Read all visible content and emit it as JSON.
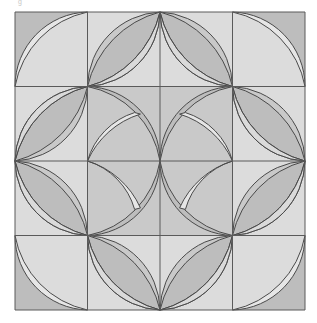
{
  "figure": {
    "corner_label": "g",
    "grid": {
      "rows": 4,
      "cols": 4,
      "x0": 15,
      "y0": 12,
      "x1": 305,
      "y1": 310
    },
    "colors": {
      "dark": "#bdbdbd",
      "medium": "#c9c9c9",
      "light": "#dcdcdc",
      "lighter": "#e6e6e6",
      "line": "#4a4a4a",
      "border": "#5a5a5a"
    },
    "cells": [
      {
        "r": 0,
        "c": 0,
        "type": "crescent",
        "corner": "BR",
        "bg": "dark"
      },
      {
        "r": 0,
        "c": 1,
        "type": "lens",
        "diag": "BL-TR",
        "bg": "light",
        "lens": "medium"
      },
      {
        "r": 0,
        "c": 2,
        "type": "lens",
        "diag": "TL-BR",
        "bg": "light",
        "lens": "medium"
      },
      {
        "r": 0,
        "c": 3,
        "type": "crescent",
        "corner": "BL",
        "bg": "dark"
      },
      {
        "r": 1,
        "c": 0,
        "type": "lens",
        "diag": "TR-BL",
        "bg": "light",
        "lens": "medium"
      },
      {
        "r": 1,
        "c": 1,
        "type": "weave",
        "corner": "BL",
        "bg": "medium"
      },
      {
        "r": 1,
        "c": 2,
        "type": "weave",
        "corner": "BR",
        "bg": "medium"
      },
      {
        "r": 1,
        "c": 3,
        "type": "lens",
        "diag": "TL-BR",
        "bg": "light",
        "lens": "medium"
      },
      {
        "r": 2,
        "c": 0,
        "type": "lens",
        "diag": "TL-BR",
        "bg": "light",
        "lens": "medium"
      },
      {
        "r": 2,
        "c": 1,
        "type": "weave",
        "corner": "TL",
        "bg": "medium"
      },
      {
        "r": 2,
        "c": 2,
        "type": "weave",
        "corner": "TR",
        "bg": "medium"
      },
      {
        "r": 2,
        "c": 3,
        "type": "lens",
        "diag": "BL-TR",
        "bg": "light",
        "lens": "medium"
      },
      {
        "r": 3,
        "c": 0,
        "type": "crescent",
        "corner": "TR",
        "bg": "dark"
      },
      {
        "r": 3,
        "c": 1,
        "type": "lens",
        "diag": "TL-BR",
        "bg": "light",
        "lens": "medium"
      },
      {
        "r": 3,
        "c": 2,
        "type": "lens",
        "diag": "BL-TR",
        "bg": "light",
        "lens": "medium"
      },
      {
        "r": 3,
        "c": 3,
        "type": "crescent",
        "corner": "TL",
        "bg": "dark"
      }
    ]
  }
}
